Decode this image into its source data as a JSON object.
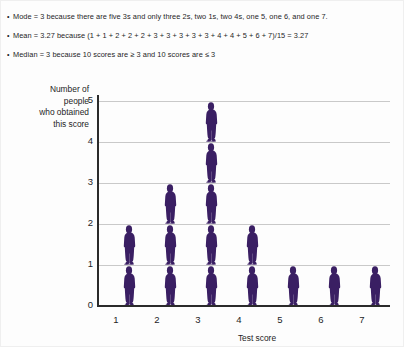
{
  "notes": {
    "bullet": "•",
    "lines": [
      "Mode = 3 because there are five 3s and only three 2s, two 1s, two 4s, one 5, one 6, and one 7.",
      "Mean = 3.27 because (1 + 1 + 2 + 2 + 2 + 3 + 3 + 3 + 3 + 3 + 4 + 4 + 5 + 6 + 7)/15 = 3.27",
      "Median = 3 because 10 scores are ≥  3 and 10 scores are ≤ 3"
    ]
  },
  "chart_data": {
    "type": "bar",
    "subtype": "pictograph",
    "title": "",
    "xlabel": "Test score",
    "ylabel": "Number of\npeople\nwho obtained\nthis score",
    "ylabel_lines": [
      "Number of",
      "people",
      "who obtained",
      "this score"
    ],
    "categories": [
      "1",
      "2",
      "3",
      "4",
      "5",
      "6",
      "7"
    ],
    "values": [
      2,
      3,
      5,
      2,
      1,
      1,
      1
    ],
    "xlim": [
      0.5,
      7.5
    ],
    "ylim": [
      0,
      5
    ],
    "yticks": [
      "0",
      "1",
      "2",
      "3",
      "4",
      "5"
    ],
    "xticks": [
      "1",
      "2",
      "3",
      "4",
      "5",
      "6",
      "7"
    ],
    "grid": true,
    "grid_axis": "y",
    "legend": "none",
    "marker": "person-figure-icon",
    "marker_color": "#3a1f63",
    "grid_color": "#c9c9c9",
    "axis_color": "#2b2b2b"
  }
}
